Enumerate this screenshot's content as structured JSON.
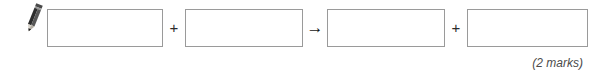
{
  "page": {
    "background_color": "#ffffff",
    "width": 597,
    "height": 75
  },
  "question": {
    "icon": "pencil-icon",
    "icon_color": "#3a3a3a",
    "box_border_color": "#9a9a9a",
    "box_fill_color": "#ffffff",
    "equation": {
      "elements": [
        {
          "type": "answer-box",
          "value": "",
          "placeholder": ""
        },
        {
          "type": "operator",
          "value": "+"
        },
        {
          "type": "answer-box",
          "value": "",
          "placeholder": ""
        },
        {
          "type": "operator",
          "value": "→"
        },
        {
          "type": "answer-box",
          "value": "",
          "placeholder": ""
        },
        {
          "type": "operator",
          "value": "+"
        },
        {
          "type": "answer-box",
          "value": "",
          "placeholder": ""
        }
      ],
      "operators": {
        "plus_1": "+",
        "arrow": "→",
        "plus_2": "+"
      },
      "boxes": [
        {
          "id": "box-1",
          "value": ""
        },
        {
          "id": "box-2",
          "value": ""
        },
        {
          "id": "box-3",
          "value": ""
        },
        {
          "id": "box-4",
          "value": ""
        }
      ]
    },
    "marks_label": "(2 marks)",
    "marks_color": "#4a4a4a"
  }
}
